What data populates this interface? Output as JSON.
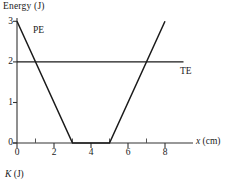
{
  "chart_data": {
    "type": "line",
    "title": "",
    "ylabel": "Energy (J)",
    "xlabel": "x (cm)",
    "secondary_axis_label": "K (J)",
    "xlim": [
      0,
      9
    ],
    "ylim": [
      0,
      3.1
    ],
    "grid": false,
    "legend": "inline-annotations",
    "x_ticks_major": [
      0,
      2,
      4,
      6,
      8
    ],
    "x_ticks_minor": [
      1,
      3,
      5,
      7
    ],
    "x_tick_labels": [
      "0",
      "2",
      "4",
      "6",
      "8"
    ],
    "y_ticks": [
      0,
      1,
      2,
      3
    ],
    "y_tick_labels": [
      "0",
      "1",
      "2",
      "3"
    ],
    "series": [
      {
        "name": "PE",
        "label": "PE",
        "color": "#1a1a1a",
        "x": [
          0,
          3,
          5,
          8
        ],
        "values": [
          3,
          0,
          0,
          3
        ]
      },
      {
        "name": "TE",
        "label": "TE",
        "color": "#1a1a1a",
        "x": [
          0,
          9
        ],
        "values": [
          2,
          2
        ]
      }
    ],
    "annotations": [
      {
        "text": "PE",
        "x": 0.9,
        "y": 2.55
      },
      {
        "text": "TE",
        "x": 8.7,
        "y": 1.75
      }
    ],
    "intersections": [
      {
        "x": 1,
        "y": 2
      },
      {
        "x": 7,
        "y": 2
      }
    ]
  },
  "axis": {
    "y_title": "Energy (J)",
    "x_title_italic": "x",
    "x_title_rest": " (cm)",
    "k_title_italic": "K",
    "k_title_rest": " (J)"
  }
}
